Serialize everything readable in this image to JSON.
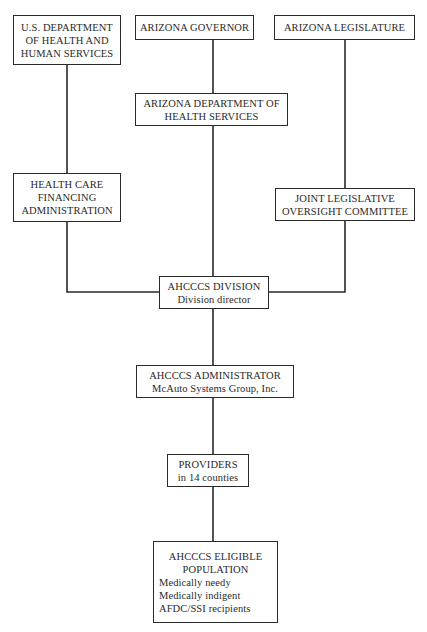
{
  "diagram": {
    "type": "organization-chart",
    "nodes": {
      "hhs": {
        "lines": [
          "U.S. DEPARTMENT",
          "OF HEALTH AND",
          "HUMAN SERVICES"
        ]
      },
      "governor": {
        "lines": [
          "ARIZONA GOVERNOR"
        ]
      },
      "legislature": {
        "lines": [
          "ARIZONA LEGISLATURE"
        ]
      },
      "adhs": {
        "lines": [
          "ARIZONA DEPARTMENT OF",
          "HEALTH SERVICES"
        ]
      },
      "hcfa": {
        "lines": [
          "HEALTH CARE",
          "FINANCING",
          "ADMINISTRATION"
        ]
      },
      "jloc": {
        "lines": [
          "JOINT LEGISLATIVE",
          "OVERSIGHT COMMITTEE"
        ]
      },
      "division": {
        "lines": [
          "AHCCCS DIVISION",
          "Division director"
        ]
      },
      "administrator": {
        "lines": [
          "AHCCCS ADMINISTRATOR",
          "McAuto Systems Group, Inc."
        ]
      },
      "providers": {
        "lines": [
          "PROVIDERS",
          "in 14 counties"
        ]
      },
      "eligible": {
        "title_lines": [
          "AHCCCS ELIGIBLE",
          "POPULATION"
        ],
        "items": [
          "Medically needy",
          "Medically indigent",
          "AFDC/SSI recipients"
        ]
      }
    },
    "edges": [
      [
        "hhs",
        "hcfa"
      ],
      [
        "hcfa",
        "division"
      ],
      [
        "governor",
        "adhs"
      ],
      [
        "adhs",
        "division"
      ],
      [
        "legislature",
        "jloc"
      ],
      [
        "jloc",
        "division"
      ],
      [
        "division",
        "administrator"
      ],
      [
        "administrator",
        "providers"
      ],
      [
        "providers",
        "eligible"
      ]
    ],
    "line_color": "#2a2a2a"
  }
}
